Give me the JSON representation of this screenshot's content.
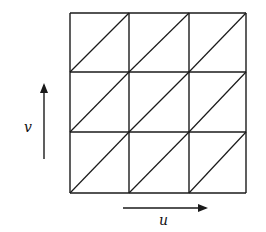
{
  "diagram": {
    "type": "triangulated-grid",
    "rows": 3,
    "cols": 3,
    "diagonal_direction": "bottom-left to top-right",
    "grid": {
      "x_lines": [
        70,
        129,
        189,
        246
      ],
      "y_lines": [
        13,
        72,
        132,
        193
      ]
    },
    "axes": {
      "u": {
        "label": "u",
        "direction": "right"
      },
      "v": {
        "label": "v",
        "direction": "up"
      }
    },
    "colors": {
      "stroke": "#1a1a1a",
      "background": "#ffffff"
    }
  }
}
